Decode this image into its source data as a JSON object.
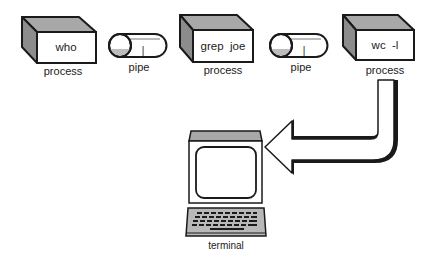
{
  "diagram": {
    "title": "",
    "colors": {
      "outline": "#1a1a1a",
      "shade_top": "#a8a8a8",
      "shade_side": "#8c8c8c",
      "face": "#ffffff",
      "keyboard": "#b8b8b8"
    },
    "nodes": [
      {
        "id": "p1",
        "type": "process",
        "command": "who",
        "label": "process"
      },
      {
        "id": "pipe1",
        "type": "pipe",
        "symbol": "|",
        "label": "pipe"
      },
      {
        "id": "p2",
        "type": "process",
        "command": "grep  joe",
        "label": "process"
      },
      {
        "id": "pipe2",
        "type": "pipe",
        "symbol": "|",
        "label": "pipe"
      },
      {
        "id": "p3",
        "type": "process",
        "command": "wc  -l",
        "label": "process"
      },
      {
        "id": "term",
        "type": "terminal",
        "label": "terminal"
      }
    ],
    "edges": [
      {
        "from": "p3",
        "to": "term",
        "style": "bent-block-arrow"
      }
    ]
  }
}
